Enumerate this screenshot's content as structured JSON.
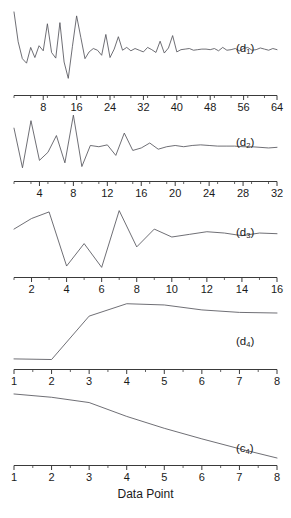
{
  "chart_data": {
    "type": "line",
    "title": "",
    "xlabel": "Data Point",
    "ylabel": "",
    "grid": false,
    "legend": "none",
    "panel_label_position": "inside-right",
    "panels": [
      {
        "name": "d1",
        "label_text": "(d",
        "label_sub": "1",
        "label_close": ")",
        "xlabel": "",
        "xlim": [
          1,
          64
        ],
        "xticks": [
          8,
          16,
          24,
          32,
          40,
          48,
          56,
          64
        ],
        "xtick_labels": [
          "8",
          "16",
          "24",
          "32",
          "40",
          "48",
          "56",
          "64"
        ],
        "minor_tick_step": 4,
        "n_points": 64,
        "x": [
          1,
          2,
          3,
          4,
          5,
          6,
          7,
          8,
          9,
          10,
          11,
          12,
          13,
          14,
          15,
          16,
          17,
          18,
          19,
          20,
          21,
          22,
          23,
          24,
          25,
          26,
          27,
          28,
          29,
          30,
          31,
          32,
          33,
          34,
          35,
          36,
          37,
          38,
          39,
          40,
          41,
          42,
          43,
          44,
          45,
          46,
          47,
          48,
          49,
          50,
          51,
          52,
          53,
          54,
          55,
          56,
          57,
          58,
          59,
          60,
          61,
          62,
          63,
          64
        ],
        "values": [
          0.93,
          0.4,
          0.1,
          0.02,
          0.3,
          0.12,
          0.33,
          0.24,
          0.72,
          0.21,
          0.11,
          0.74,
          0.04,
          -0.25,
          0.32,
          0.86,
          0.48,
          0.1,
          0.22,
          0.28,
          0.25,
          0.16,
          0.53,
          0.12,
          0.27,
          0.49,
          0.25,
          0.3,
          0.24,
          0.28,
          0.25,
          0.22,
          0.3,
          0.26,
          0.21,
          0.41,
          0.2,
          0.29,
          0.51,
          0.22,
          0.26,
          0.27,
          0.28,
          0.25,
          0.26,
          0.27,
          0.27,
          0.26,
          0.28,
          0.24,
          0.3,
          0.25,
          0.26,
          0.28,
          0.24,
          0.28,
          0.3,
          0.25,
          0.26,
          0.29,
          0.27,
          0.25,
          0.28,
          0.26
        ],
        "ylim": [
          -0.35,
          1.0
        ]
      },
      {
        "name": "d2",
        "label_text": "(d",
        "label_sub": "2",
        "label_close": ")",
        "xlabel": "",
        "xlim": [
          1,
          32
        ],
        "xticks": [
          4,
          8,
          12,
          16,
          20,
          24,
          28,
          32
        ],
        "xtick_labels": [
          "4",
          "8",
          "12",
          "16",
          "20",
          "24",
          "28",
          "32"
        ],
        "minor_tick_step": 2,
        "n_points": 32,
        "x": [
          1,
          2,
          3,
          4,
          5,
          6,
          7,
          8,
          9,
          10,
          11,
          12,
          13,
          14,
          15,
          16,
          17,
          18,
          19,
          20,
          21,
          22,
          23,
          24,
          25,
          26,
          27,
          28,
          29,
          30,
          31,
          32
        ],
        "values": [
          0.74,
          0.1,
          0.86,
          0.22,
          0.35,
          0.62,
          0.18,
          0.95,
          0.12,
          0.46,
          0.44,
          0.47,
          0.3,
          0.66,
          0.38,
          0.42,
          0.5,
          0.4,
          0.44,
          0.46,
          0.44,
          0.46,
          0.47,
          0.46,
          0.45,
          0.45,
          0.45,
          0.44,
          0.44,
          0.43,
          0.42,
          0.43
        ],
        "ylim": [
          0.0,
          1.0
        ]
      },
      {
        "name": "d3",
        "label_text": "(d",
        "label_sub": "3",
        "label_close": ")",
        "xlabel": "",
        "xlim": [
          1,
          16
        ],
        "xticks": [
          2,
          4,
          6,
          8,
          10,
          12,
          14,
          16
        ],
        "xtick_labels": [
          "2",
          "4",
          "6",
          "8",
          "10",
          "12",
          "14",
          "16"
        ],
        "minor_tick_step": 1,
        "n_points": 16,
        "x": [
          1,
          2,
          3,
          4,
          5,
          6,
          7,
          8,
          9,
          10,
          11,
          12,
          13,
          14,
          15,
          16
        ],
        "values": [
          0.62,
          0.78,
          0.88,
          0.06,
          0.4,
          0.04,
          0.9,
          0.35,
          0.62,
          0.5,
          0.54,
          0.58,
          0.56,
          0.52,
          0.56,
          0.55
        ],
        "ylim": [
          0.0,
          1.0
        ]
      },
      {
        "name": "d4",
        "label_text": "(d",
        "label_sub": "4",
        "label_close": ")",
        "xlabel": "",
        "xlim": [
          1,
          8
        ],
        "xticks": [
          1,
          2,
          3,
          4,
          5,
          6,
          7,
          8
        ],
        "xtick_labels": [
          "1",
          "2",
          "3",
          "4",
          "5",
          "6",
          "7",
          "8"
        ],
        "minor_tick_step": 0.5,
        "n_points": 8,
        "x": [
          1,
          2,
          3,
          4,
          5,
          6,
          7,
          8
        ],
        "values": [
          0.05,
          0.04,
          0.74,
          0.94,
          0.92,
          0.84,
          0.8,
          0.79
        ],
        "ylim": [
          0.0,
          1.0
        ]
      },
      {
        "name": "c4",
        "label_text": "(c",
        "label_sub": "4",
        "label_close": ")",
        "xlabel": "Data Point",
        "xlim": [
          1,
          8
        ],
        "xticks": [
          1,
          2,
          3,
          4,
          5,
          6,
          7,
          8
        ],
        "xtick_labels": [
          "1",
          "2",
          "3",
          "4",
          "5",
          "6",
          "7",
          "8"
        ],
        "minor_tick_step": 0.5,
        "n_points": 8,
        "x": [
          1,
          2,
          3,
          4,
          5,
          6,
          7,
          8
        ],
        "values": [
          0.97,
          0.92,
          0.84,
          0.63,
          0.45,
          0.29,
          0.14,
          0.0
        ],
        "ylim": [
          0.0,
          1.0
        ]
      }
    ],
    "colors": {
      "line": "#55555c",
      "axis": "#3a3a3a",
      "text": "#1a1a1a",
      "background": "#ffffff"
    }
  }
}
